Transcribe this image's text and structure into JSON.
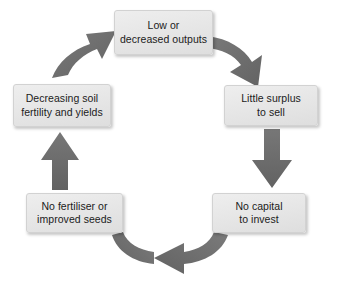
{
  "diagram": {
    "type": "cycle",
    "direction": "clockwise",
    "colors": {
      "arrow": "#6e6e6e",
      "arrow_shade": "#5f5f5f",
      "box_fill": "#e7e7e7",
      "box_border": "#d2d2d2",
      "text": "#1b1b1b",
      "background": "#ffffff"
    },
    "nodes": [
      {
        "id": "low-outputs",
        "label": "Low or\ndecreased outputs",
        "position": "top"
      },
      {
        "id": "little-surplus",
        "label": "Little surplus\nto sell",
        "position": "right"
      },
      {
        "id": "no-capital",
        "label": "No capital\nto invest",
        "position": "bottom-right"
      },
      {
        "id": "no-fertiliser",
        "label": "No fertiliser or\nimproved seeds",
        "position": "bottom-left"
      },
      {
        "id": "decreasing-soil",
        "label": "Decreasing soil\nfertility and yields",
        "position": "left"
      }
    ],
    "arrows": [
      {
        "id": "arrow-top-to-right",
        "from": "low-outputs",
        "to": "little-surplus",
        "direction": "down-right"
      },
      {
        "id": "arrow-right-to-lower",
        "from": "little-surplus",
        "to": "no-capital",
        "direction": "down"
      },
      {
        "id": "arrow-bottom-leftward",
        "from": "no-capital",
        "to": "no-fertiliser",
        "direction": "left"
      },
      {
        "id": "arrow-left-upward",
        "from": "no-fertiliser",
        "to": "decreasing-soil",
        "direction": "up"
      },
      {
        "id": "arrow-upper-left",
        "from": "decreasing-soil",
        "to": "low-outputs",
        "direction": "up-right"
      }
    ]
  }
}
